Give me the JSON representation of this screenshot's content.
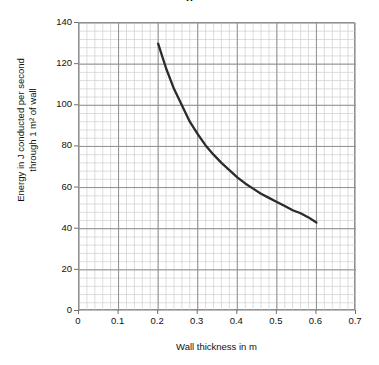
{
  "figure": {
    "title_fragment": "g",
    "background": "#ffffff"
  },
  "axis": {
    "x_label": "Wall thickness in m",
    "y_label_line1": "Energy in J conducted per second",
    "y_label_line2": "through 1 m² of wall",
    "x_ticks": [
      "0",
      "0.1",
      "0.2",
      "0.3",
      "0.4",
      "0.5",
      "0.6",
      "0.7"
    ],
    "y_ticks": [
      "0",
      "20",
      "40",
      "60",
      "80",
      "100",
      "120",
      "140"
    ]
  },
  "colors": {
    "curve": "#2b2b2b",
    "major_grid": "#8f8f8f",
    "minor_grid": "#cfcfcf",
    "axis": "#6f6f6f",
    "text": "#111111"
  },
  "chart_data": {
    "type": "line",
    "title": "",
    "xlabel": "Wall thickness in m",
    "ylabel": "Energy in J conducted per second through 1 m² of wall",
    "xlim": [
      0,
      0.7
    ],
    "ylim": [
      0,
      140
    ],
    "x_tick_values": [
      0,
      0.1,
      0.2,
      0.3,
      0.4,
      0.5,
      0.6,
      0.7
    ],
    "y_tick_values": [
      0,
      20,
      40,
      60,
      80,
      100,
      120,
      140
    ],
    "grid": true,
    "minor_grid": true,
    "minor_divisions_per_major": 5,
    "legend": null,
    "series": [
      {
        "name": "Energy conducted vs wall thickness",
        "x": [
          0.2,
          0.22,
          0.24,
          0.26,
          0.28,
          0.3,
          0.32,
          0.34,
          0.36,
          0.38,
          0.4,
          0.42,
          0.44,
          0.46,
          0.48,
          0.5,
          0.52,
          0.54,
          0.56,
          0.58,
          0.6
        ],
        "y": [
          130,
          118,
          108,
          100,
          92,
          86,
          80.5,
          76,
          72,
          68.5,
          65,
          62,
          59.5,
          57,
          55,
          53,
          51,
          49,
          47.5,
          45.5,
          43
        ]
      }
    ]
  }
}
